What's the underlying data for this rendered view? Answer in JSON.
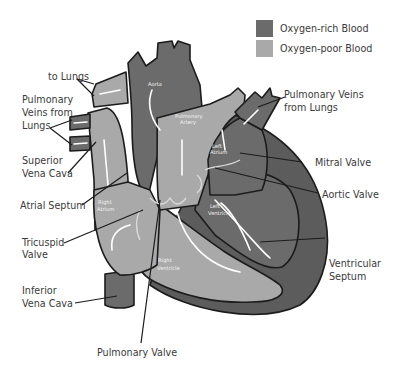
{
  "colors": {
    "oxygen_rich": "#6b6b6b",
    "oxygen_poor": "#a9a9a9",
    "septum": "#5c5c5c",
    "outline": "#1c1c1c",
    "flow_arrow": "#ffffff"
  },
  "legend": [
    {
      "key": "oxygen_rich",
      "label": "Oxygen-rich Blood"
    },
    {
      "key": "oxygen_poor",
      "label": "Oxygen-poor Blood"
    }
  ],
  "labels": {
    "to_lungs": "to Lungs",
    "pulmonary_veins_left": [
      "Pulmonary",
      "Veins from",
      "Lungs"
    ],
    "superior_vena_cava": [
      "Superior",
      "Vena Cava"
    ],
    "atrial_septum": "Atrial Septum",
    "tricuspid_valve": [
      "Tricuspid",
      "Valve"
    ],
    "inferior_vena_cava": [
      "Inferior",
      "Vena Cava"
    ],
    "pulmonary_valve": "Pulmonary Valve",
    "pulmonary_veins_right": [
      "Pulmonary Veins",
      "from Lungs"
    ],
    "mitral_valve": "Mitral Valve",
    "aortic_valve": "Aortic Valve",
    "ventricular_septum": [
      "Ventricular",
      "Septum"
    ]
  },
  "inner_labels": {
    "aorta": "Aorta",
    "pulmonary_artery": [
      "Pulmonary",
      "Artery"
    ],
    "left_atrium": [
      "Left",
      "Atrium"
    ],
    "right_atrium": [
      "Right",
      "Atrium"
    ],
    "left_ventricle": [
      "Left",
      "Ventricle"
    ],
    "right_ventricle": [
      "Right",
      "Ventricle"
    ]
  }
}
